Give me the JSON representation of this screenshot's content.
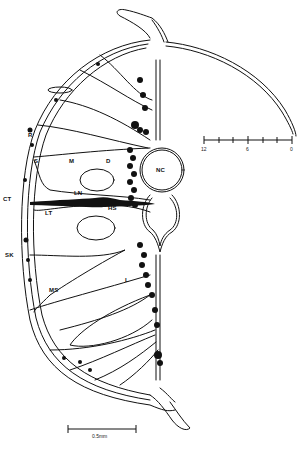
{
  "figure": {
    "line_color": "#111111",
    "background": "#ffffff"
  },
  "labels": {
    "R": "R",
    "S": "S",
    "M": "M",
    "D": "D",
    "CT": "CT",
    "LN": "LN",
    "HS": "HS",
    "LT": "LT",
    "NC": "NC",
    "SK": "SK",
    "MS": "MS",
    "L": "L"
  },
  "scale_ruler": {
    "ticks": 7,
    "labels": [
      "12",
      "6",
      "0"
    ]
  },
  "scale_bar": {
    "label": "0.5mm"
  }
}
